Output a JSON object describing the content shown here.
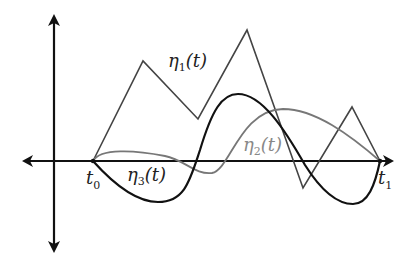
{
  "diagram": {
    "type": "function-variations",
    "axes": {
      "origin": [
        54,
        161
      ],
      "x_axis": {
        "from": [
          22,
          161
        ],
        "to": [
          393,
          161
        ],
        "arrows": "both"
      },
      "y_axis": {
        "from": [
          54,
          14
        ],
        "to": [
          54,
          253
        ],
        "arrows": "both"
      }
    },
    "labels": {
      "t0": {
        "main": "t",
        "sub": "0"
      },
      "t1": {
        "main": "t",
        "sub": "1"
      },
      "eta1": {
        "main": "η",
        "sub": "1",
        "arg": "(t)"
      },
      "eta2": {
        "main": "η",
        "sub": "2",
        "arg": "(t)"
      },
      "eta3": {
        "main": "η",
        "sub": "3",
        "arg": "(t)"
      }
    },
    "colors": {
      "axis": "#111111",
      "eta1": "#444444",
      "eta2": "#777777",
      "eta3": "#111111",
      "eta2_label": "#888888"
    },
    "curves": [
      {
        "name": "eta1",
        "kind": "polyline",
        "points": [
          [
            93,
            161
          ],
          [
            143,
            61
          ],
          [
            198,
            119
          ],
          [
            247,
            30
          ],
          [
            303,
            188
          ],
          [
            352,
            107
          ],
          [
            380,
            161
          ]
        ]
      },
      {
        "name": "eta2",
        "kind": "smooth-curve",
        "description": "small bump above axis after t0, dips below near t≈210, peaks near (283,109), returns to t1"
      },
      {
        "name": "eta3",
        "kind": "smooth-curve",
        "description": "dips to minimum near (155,202), rises to peak near (238,94), falls to minimum near (353,204), returns to t1"
      }
    ],
    "endpoints": {
      "t0": [
        93,
        161
      ],
      "t1": [
        380,
        161
      ]
    }
  }
}
